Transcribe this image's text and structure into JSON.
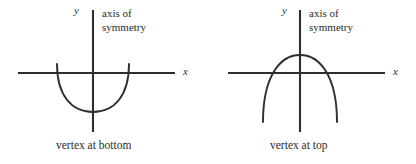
{
  "figure": {
    "type": "math-diagram",
    "stroke_color": "#2e2e2e",
    "text_color": "#2b2b2b",
    "background_color": "#ffffff"
  },
  "diagrams": [
    {
      "id": "vertex-at-bottom",
      "y_axis_label": "y",
      "x_axis_label": "x",
      "annotation_line1": "axis of",
      "annotation_line2": "symmetry",
      "caption": "vertex at bottom",
      "opens": "up",
      "vertex": {
        "x": 93,
        "y": 112
      },
      "axes": {
        "x_axis_y": 73,
        "x_axis_from": 18,
        "x_axis_to": 175,
        "y_axis_x": 93,
        "y_axis_from": 10,
        "y_axis_to": 132
      },
      "curve_path": "M 57 64 C 57 96, 72 112, 93 112 C 114 112, 129 96, 129 64"
    },
    {
      "id": "vertex-at-top",
      "y_axis_label": "y",
      "x_axis_label": "x",
      "annotation_line1": "axis of",
      "annotation_line2": "symmetry",
      "caption": "vertex at top",
      "opens": "down",
      "vertex": {
        "x": 92,
        "y": 55
      },
      "axes": {
        "x_axis_y": 73,
        "x_axis_from": 20,
        "x_axis_to": 177,
        "y_axis_x": 92,
        "y_axis_from": 10,
        "y_axis_to": 132
      },
      "curve_path": "M 55 122 C 55 78, 71 55, 92 55 C 113 55, 129 78, 129 122"
    }
  ]
}
